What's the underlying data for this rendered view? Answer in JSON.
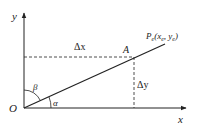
{
  "diagram": {
    "type": "coordinate-geometry",
    "axes": {
      "x_label": "x",
      "y_label": "y",
      "origin_label": "O"
    },
    "line": {
      "from": "O",
      "to": "Pe"
    },
    "points": {
      "A": {
        "label": "A"
      },
      "Pe": {
        "label_main": "P",
        "label_sub": "e",
        "label_coords_open": "(x",
        "coord_x_sub": "e",
        "comma": ", y",
        "coord_y_sub": "e",
        "close": ")"
      }
    },
    "deltas": {
      "dx_label": "Δx",
      "dy_label": "Δy"
    },
    "angles": {
      "alpha": "α",
      "beta": "β"
    },
    "colors": {
      "stroke": "#222222",
      "background": "#ffffff"
    }
  }
}
